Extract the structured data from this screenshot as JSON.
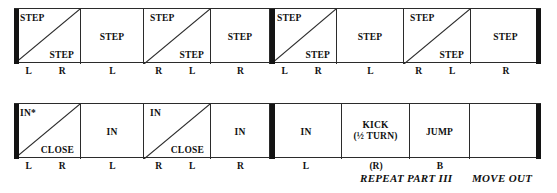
{
  "document": {
    "type": "dance-step-notation-chart",
    "rows": [
      {
        "id": "row-1",
        "cells": [
          {
            "kind": "split",
            "upper": "STEP",
            "lower": "STEP"
          },
          {
            "kind": "single",
            "center": "STEP"
          },
          {
            "kind": "split",
            "upper": "STEP",
            "lower": "STEP"
          },
          {
            "kind": "single",
            "center": "STEP"
          },
          {
            "kind": "split",
            "upper": "STEP",
            "lower": "STEP"
          },
          {
            "kind": "single",
            "center": "STEP"
          },
          {
            "kind": "split",
            "upper": "STEP",
            "lower": "STEP"
          },
          {
            "kind": "single",
            "center": "STEP"
          }
        ],
        "feet": [
          {
            "left": "L",
            "right": "R"
          },
          {
            "mid": "L"
          },
          {
            "left": "R",
            "right": "L"
          },
          {
            "mid": "R"
          },
          {
            "left": "L",
            "right": "R"
          },
          {
            "mid": "L"
          },
          {
            "left": "R",
            "right": "L"
          },
          {
            "mid": "R"
          }
        ]
      },
      {
        "id": "row-2",
        "cells": [
          {
            "kind": "split",
            "upper": "IN*",
            "lower": "CLOSE"
          },
          {
            "kind": "single",
            "center": "IN"
          },
          {
            "kind": "split",
            "upper": "IN",
            "lower": "CLOSE"
          },
          {
            "kind": "single",
            "center": "IN"
          },
          {
            "kind": "single",
            "center": "IN"
          },
          {
            "kind": "two-line",
            "line1": "KICK",
            "line2": "(½ TURN)"
          },
          {
            "kind": "single",
            "center": "JUMP"
          },
          {
            "kind": "empty",
            "center": ""
          }
        ],
        "feet": [
          {
            "left": "L",
            "right": "R"
          },
          {
            "mid": "L"
          },
          {
            "left": "R",
            "right": "L"
          },
          {
            "mid": "R"
          },
          {
            "mid": "L"
          },
          {
            "mid": "(R)"
          },
          {
            "mid": "B"
          },
          {
            "mid": ""
          }
        ]
      }
    ],
    "captions": {
      "repeat": "REPEAT PART III",
      "move_out": "MOVE OUT"
    },
    "colors": {
      "ink": "#111111",
      "rule": "#2b2b2b",
      "barline": "#131313",
      "paper": "#ffffff"
    }
  }
}
